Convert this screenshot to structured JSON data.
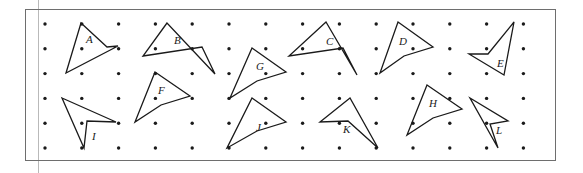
{
  "figure": {
    "kind": "dot-grid-geometry-worksheet",
    "frame": {
      "x": 25,
      "y": 9,
      "width": 531,
      "height": 152,
      "stroke": "#6e6e6e",
      "stroke_width": 1
    },
    "margin_rule": {
      "x": 38,
      "stroke": "#b9b9b9"
    },
    "background": "#ffffff",
    "ink": "#1a1a1a"
  },
  "dot_grid": {
    "origin_x": 45,
    "origin_y": 24,
    "spacing_x": 36.8,
    "spacing_y": 24.8,
    "columns": 14,
    "rows": 6,
    "dot_radius": 1.7,
    "dot_color": "#1a1a1a"
  },
  "shapes": [
    {
      "label": "A",
      "label_x": 86,
      "label_y": 34,
      "stroke": "#1a1a1a",
      "stroke_width": 1.3,
      "points": "81,23 107,47 118,46 66,73"
    },
    {
      "label": "B",
      "label_x": 174,
      "label_y": 35,
      "stroke": "#1a1a1a",
      "stroke_width": 1.3,
      "points": "167,23 143,56 202,47 215,74"
    },
    {
      "label": "C",
      "label_x": 326,
      "label_y": 36,
      "stroke": "#1a1a1a",
      "stroke_width": 1.3,
      "points": "326,22 289,56 343,48 357,75"
    },
    {
      "label": "D",
      "label_x": 399,
      "label_y": 36,
      "stroke": "#1a1a1a",
      "stroke_width": 1.3,
      "points": "398,22 433,47 404,56 380,73"
    },
    {
      "label": "E",
      "label_x": 497,
      "label_y": 58,
      "stroke": "#1a1a1a",
      "stroke_width": 1.3,
      "points": "514,22 488,54 469,54 504,75"
    },
    {
      "label": "F",
      "label_x": 158,
      "label_y": 85,
      "stroke": "#1a1a1a",
      "stroke_width": 1.3,
      "points": "155,72 190,96 161,105 135,122"
    },
    {
      "label": "G",
      "label_x": 256,
      "label_y": 61,
      "stroke": "#1a1a1a",
      "stroke_width": 1.3,
      "points": "252,48 286,72 257,81 230,98"
    },
    {
      "label": "H",
      "label_x": 429,
      "label_y": 98,
      "stroke": "#1a1a1a",
      "stroke_width": 1.3,
      "points": "427,85 462,109 433,118 407,135"
    },
    {
      "label": "I",
      "label_x": 92,
      "label_y": 131,
      "stroke": "#1a1a1a",
      "stroke_width": 1.3,
      "points": "62,98 116,122 87,121 84,148"
    },
    {
      "label": "J",
      "label_x": 256,
      "label_y": 122,
      "stroke": "#1a1a1a",
      "stroke_width": 1.3,
      "points": "252,98 286,122 257,131 227,148"
    },
    {
      "label": "K",
      "label_x": 343,
      "label_y": 124,
      "stroke": "#1a1a1a",
      "stroke_width": 1.3,
      "points": "350,98 320,122 348,121 378,148"
    },
    {
      "label": "L",
      "label_x": 496,
      "label_y": 125,
      "stroke": "#1a1a1a",
      "stroke_width": 1.3,
      "points": "470,98 508,121 490,124 498,148"
    }
  ]
}
